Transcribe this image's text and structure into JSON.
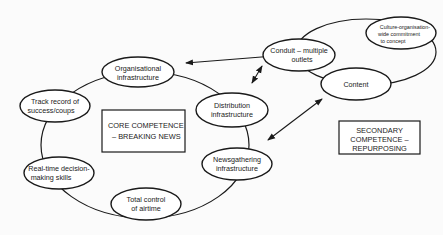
{
  "diagram": {
    "core": {
      "label_line1": "CORE COMPETENCE",
      "label_line2": "– BREAKING NEWS",
      "nodes": [
        {
          "id": "organisational",
          "line1": "Organisational",
          "line2": "infrastructure"
        },
        {
          "id": "distribution",
          "line1": "Distribution",
          "line2": "infrastructure"
        },
        {
          "id": "newsgathering",
          "line1": "Newsgathering",
          "line2": "infrastructure"
        },
        {
          "id": "airtime",
          "line1": "Total control",
          "line2": "of airtime"
        },
        {
          "id": "decision",
          "line1": "Real-time decision-",
          "line2": "making skills"
        },
        {
          "id": "track",
          "line1": "Track record of",
          "line2": "success/coups"
        }
      ]
    },
    "secondary": {
      "label_line1": "SECONDARY",
      "label_line2": "COMPETENCE –",
      "label_line3": "REPURPOSING",
      "nodes": [
        {
          "id": "conduit",
          "line1": "Conduit – multiple",
          "line2": "outlets"
        },
        {
          "id": "culture",
          "line1": "Culture-organisation-",
          "line2": "wide commitment",
          "line3": "to concept"
        },
        {
          "id": "content",
          "line1": "Content"
        }
      ]
    },
    "connections": [
      {
        "from": "organisational",
        "to": "conduit",
        "type": "bidirectional"
      },
      {
        "from": "distribution",
        "to": "conduit",
        "type": "bidirectional"
      },
      {
        "from": "newsgathering",
        "to": "content",
        "type": "bidirectional"
      }
    ]
  }
}
